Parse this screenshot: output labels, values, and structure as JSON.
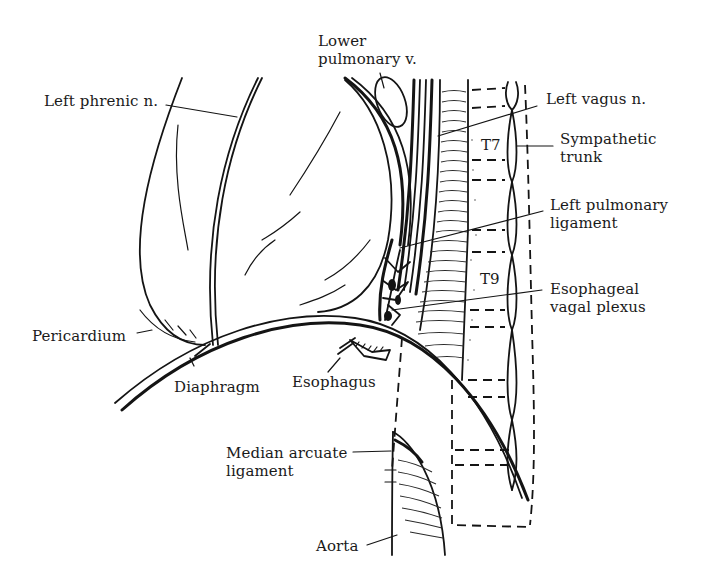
{
  "figure": {
    "type": "anatomical line illustration",
    "colors": {
      "ink": "#141414",
      "background": "#ffffff"
    }
  },
  "labels": {
    "lower_pulmonary_v": {
      "line1": "Lower",
      "line2": "pulmonary v."
    },
    "left_phrenic_n": {
      "line1": "Left phrenic n."
    },
    "left_vagus_n": {
      "line1": "Left vagus n."
    },
    "sympathetic_trunk": {
      "line1": "Sympathetic",
      "line2": "trunk"
    },
    "t7": {
      "line1": "T7"
    },
    "left_pulmonary_ligament": {
      "line1": "Left pulmonary",
      "line2": "ligament"
    },
    "t9": {
      "line1": "T9"
    },
    "esophageal_vagal_plexus": {
      "line1": "Esophageal",
      "line2": "vagal plexus"
    },
    "pericardium": {
      "line1": "Pericardium"
    },
    "diaphragm": {
      "line1": "Diaphragm"
    },
    "esophagus": {
      "line1": "Esophagus"
    },
    "median_arcuate_ligament": {
      "line1": "Median arcuate",
      "line2": "ligament"
    },
    "aorta": {
      "line1": "Aorta"
    }
  }
}
